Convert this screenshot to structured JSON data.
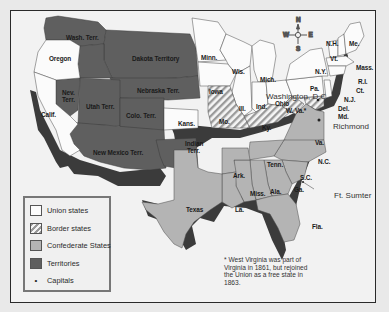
{
  "map": {
    "title": "",
    "colors": {
      "union": "#fbfbfb",
      "border": "#9a9a9a",
      "confederate": "#b4b4b4",
      "territory": "#5f5f5f",
      "shadow": "#3a3a3a",
      "frame_bg": "#f2f2f2"
    },
    "labels": {
      "wash_terr": "Wash. Terr.",
      "oregon": "Oregon",
      "dakota": "Dakota Territory",
      "nebraska": "Nebraska Terr.",
      "nev_terr_1": "Nev.",
      "nev_terr_2": "Terr.",
      "utah": "Utah Terr.",
      "colo": "Colo. Terr.",
      "calif": "Calif.",
      "kans": "Kans.",
      "new_mexico": "New Mexico Terr.",
      "indian_terr_1": "Indian",
      "indian_terr_2": "Terr.",
      "minn": "Minn.",
      "iowa": "Iowa",
      "wis": "Wis.",
      "mich": "Mich.",
      "ill": "Ill.",
      "ind": "Ind.",
      "ohio": "Ohio",
      "mo": "Mo.",
      "ky": "Ky.",
      "w_va": "W. Va.*",
      "pa": "Pa.",
      "ny": "N.Y.",
      "vt": "Vt.",
      "nh": "N.H.",
      "me": "Me.",
      "mass": "Mass.",
      "ri": "R.I.",
      "ct": "Ct.",
      "nj": "N.J.",
      "del": "Del.",
      "md": "Md.",
      "washington_dc": "Washington, D.C.",
      "richmond": "Richmond",
      "va": "Va.",
      "nc": "N.C.",
      "sc": "S.C.",
      "tenn": "Tenn.",
      "ark": "Ark.",
      "miss": "Miss.",
      "ala": "Ala.",
      "ga": "Ga.",
      "la": "La.",
      "fla": "Fla.",
      "texas": "Texas",
      "ft_sumter": "Ft. Sumter"
    },
    "compass": {
      "n": "N",
      "s": "S",
      "e": "E",
      "w": "W"
    }
  },
  "legend": {
    "items": [
      {
        "key": "union",
        "label": "Union states"
      },
      {
        "key": "border",
        "label": "Border states"
      },
      {
        "key": "confederate",
        "label": "Confederate States"
      },
      {
        "key": "territory",
        "label": "Territories"
      },
      {
        "key": "capital",
        "label": "Capitals",
        "icon": "•"
      }
    ]
  },
  "footnote": {
    "text": "* West Virginia was part of Virginia in 1861, but rejoined the Union as a free state in 1863."
  }
}
